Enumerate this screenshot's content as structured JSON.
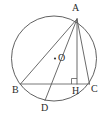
{
  "figure": {
    "type": "circle-geometry-diagram",
    "canvas": {
      "width": 105,
      "height": 123
    },
    "colors": {
      "background": "#ffffff",
      "circle_stroke": "#4f4f4f",
      "line_stroke": "#5a5a5a",
      "chord_stroke": "#6a6a6a",
      "label_color": "#2b2b2b",
      "center_dot": "#3a3a3a"
    },
    "circle": {
      "cx": 54,
      "cy": 58.5,
      "r": 42.5
    },
    "labels": {
      "A": "A",
      "O": "O",
      "B": "B",
      "H": "H",
      "C": "C",
      "D": "D"
    },
    "points": {
      "A": {
        "x": 77,
        "y": 19
      },
      "O": {
        "x": 55,
        "y": 58.5
      },
      "B": {
        "x": 20.5,
        "y": 84
      },
      "H": {
        "x": 77,
        "y": 84
      },
      "C": {
        "x": 89.5,
        "y": 84
      },
      "D": {
        "x": 45,
        "y": 100.5
      }
    },
    "segments": [
      {
        "name": "AB",
        "from": "A",
        "to": "B"
      },
      {
        "name": "AD",
        "from": "A",
        "to": "D"
      },
      {
        "name": "AH",
        "from": "A",
        "to": "H"
      },
      {
        "name": "AC",
        "from": "A",
        "to": "C"
      },
      {
        "name": "BC",
        "from": "B",
        "to": "C"
      }
    ],
    "right_angle": {
      "at": "H",
      "size": 5.5,
      "side": "left"
    }
  }
}
